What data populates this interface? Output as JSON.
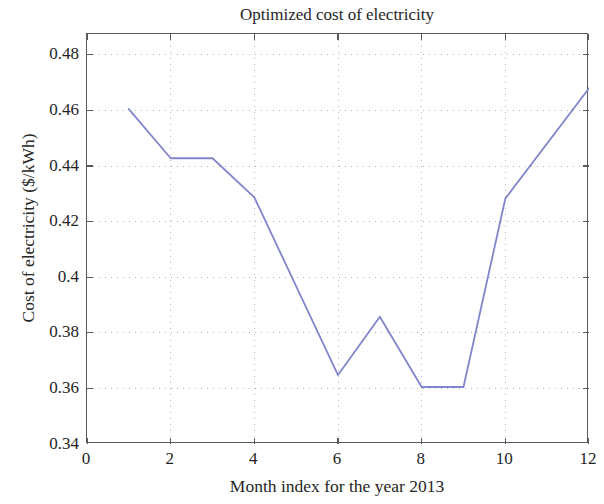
{
  "chart_data": {
    "type": "line",
    "title": "Optimized cost of electricity",
    "xlabel": "Month index for the year 2013",
    "ylabel": "Cost of electricity ($/kWh)",
    "x": [
      1,
      2,
      3,
      4,
      6,
      7,
      8,
      9,
      10,
      12
    ],
    "values": [
      0.4605,
      0.4428,
      0.4428,
      0.4287,
      0.3648,
      0.3858,
      0.3605,
      0.3605,
      0.4283,
      0.468
    ],
    "series": [
      {
        "name": "Optimized cost of electricity",
        "color": "#8186cc",
        "points": [
          {
            "x": 1,
            "y": 0.4605
          },
          {
            "x": 2,
            "y": 0.4428
          },
          {
            "x": 3,
            "y": 0.4428
          },
          {
            "x": 4,
            "y": 0.4287
          },
          {
            "x": 6,
            "y": 0.3648
          },
          {
            "x": 7,
            "y": 0.3858
          },
          {
            "x": 8,
            "y": 0.3605
          },
          {
            "x": 9,
            "y": 0.3605
          },
          {
            "x": 10,
            "y": 0.4283
          },
          {
            "x": 12,
            "y": 0.468
          }
        ]
      }
    ],
    "xlim": [
      0,
      12
    ],
    "ylim": [
      0.34,
      0.4875
    ],
    "xticks": [
      0,
      2,
      4,
      6,
      8,
      10,
      12
    ],
    "xtick_labels": [
      "0",
      "2",
      "4",
      "6",
      "8",
      "10",
      "12"
    ],
    "yticks": [
      0.36,
      0.38,
      0.4,
      0.42,
      0.44,
      0.46,
      0.48
    ],
    "ytick_labels": [
      "0.36",
      "0.38",
      "0.4",
      "0.42",
      "0.44",
      "0.46",
      "0.48"
    ],
    "y_axis_start_label": "0.34",
    "grid": true,
    "grid_style": "dotted",
    "grid_color": "#b5b5b5",
    "legend": null,
    "legend_position": "none",
    "axis_color": "#595959",
    "background": "#ffffff"
  }
}
